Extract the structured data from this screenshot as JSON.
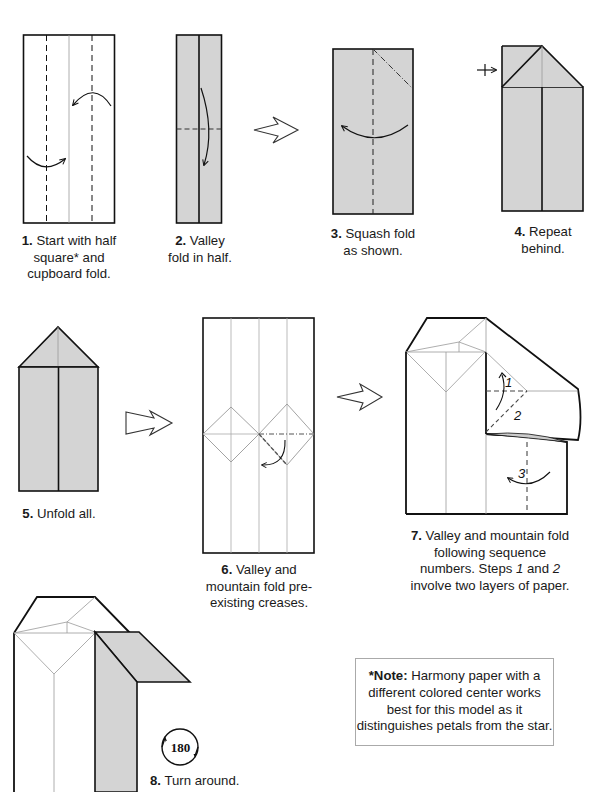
{
  "steps": [
    {
      "num": "1.",
      "text": "Start with half square* and cupboard fold.",
      "lines": [
        "Start with half",
        "square* and",
        "cupboard fold."
      ]
    },
    {
      "num": "2.",
      "text": "Valley fold in half.",
      "lines": [
        "Valley",
        "fold in half."
      ]
    },
    {
      "num": "3.",
      "text": "Squash fold as shown.",
      "lines": [
        "Squash fold",
        "as shown."
      ]
    },
    {
      "num": "4.",
      "text": "Repeat behind.",
      "lines": [
        "Repeat",
        "behind."
      ]
    },
    {
      "num": "5.",
      "text": "Unfold all.",
      "lines": [
        "Unfold all."
      ]
    },
    {
      "num": "6.",
      "text": "Valley and mountain fold pre-existing creases.",
      "lines": [
        "Valley and",
        "mountain fold pre-",
        "existing creases."
      ]
    },
    {
      "num": "7.",
      "text": "Valley and mountain fold following sequence numbers. Steps 1 and 2 involve two layers of paper.",
      "lines": [
        "Valley and mountain fold",
        "following sequence",
        "numbers.  Steps ",
        " and ",
        "involve two layers of paper."
      ]
    },
    {
      "num": "8.",
      "text": "Turn around.",
      "lines": [
        "Turn around."
      ]
    }
  ],
  "step7_italics": [
    "1",
    "2"
  ],
  "diagram_labels": {
    "seq1": "1",
    "seq2": "2",
    "seq3": "3",
    "rotate": "180"
  },
  "note": {
    "label": "*Note:",
    "text": "Harmony paper with a different colored center works best for this model as it distinguishes petals from the star."
  },
  "colors": {
    "paper_gray": "#d4d4d4",
    "line": "#111111",
    "crease": "#9a9a9a",
    "background": "#ffffff"
  }
}
